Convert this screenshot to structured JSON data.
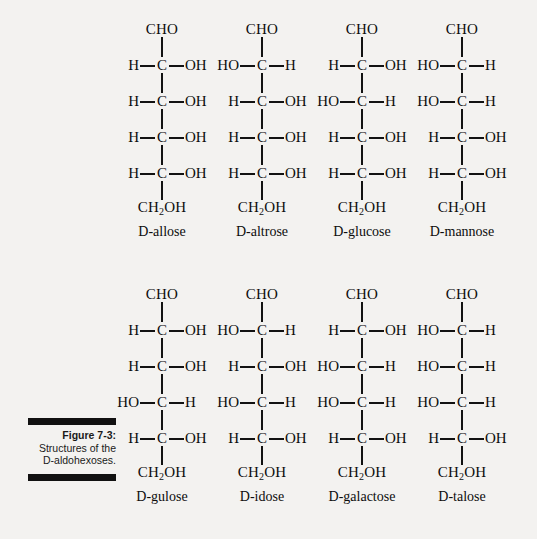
{
  "figure": {
    "caption_label": "Figure 7-3:",
    "caption_text": "Structures of the D-aldohexoses.",
    "background_color": "#f3f2f0",
    "ink_color": "#121212"
  },
  "chart_data": {
    "type": "diagram",
    "title": "Structures of the D-aldohexoses",
    "subtype": "fischer-projection-grid",
    "grid": {
      "rows": 2,
      "columns": 4
    },
    "top_group": "CHO",
    "bottom_group": "CH2OH",
    "stereocenter_count": 4,
    "carbon_symbol": "C",
    "molecules": [
      {
        "name": "D-allose",
        "row": 1,
        "column": 1,
        "top": "CHO",
        "bottom": "CH2OH",
        "centers": [
          {
            "left": "H",
            "right": "OH"
          },
          {
            "left": "H",
            "right": "OH"
          },
          {
            "left": "H",
            "right": "OH"
          },
          {
            "left": "H",
            "right": "OH"
          }
        ]
      },
      {
        "name": "D-altrose",
        "row": 1,
        "column": 2,
        "top": "CHO",
        "bottom": "CH2OH",
        "centers": [
          {
            "left": "HO",
            "right": "H"
          },
          {
            "left": "H",
            "right": "OH"
          },
          {
            "left": "H",
            "right": "OH"
          },
          {
            "left": "H",
            "right": "OH"
          }
        ]
      },
      {
        "name": "D-glucose",
        "row": 1,
        "column": 3,
        "top": "CHO",
        "bottom": "CH2OH",
        "centers": [
          {
            "left": "H",
            "right": "OH"
          },
          {
            "left": "HO",
            "right": "H"
          },
          {
            "left": "H",
            "right": "OH"
          },
          {
            "left": "H",
            "right": "OH"
          }
        ]
      },
      {
        "name": "D-mannose",
        "row": 1,
        "column": 4,
        "top": "CHO",
        "bottom": "CH2OH",
        "centers": [
          {
            "left": "HO",
            "right": "H"
          },
          {
            "left": "HO",
            "right": "H"
          },
          {
            "left": "H",
            "right": "OH"
          },
          {
            "left": "H",
            "right": "OH"
          }
        ]
      },
      {
        "name": "D-gulose",
        "row": 2,
        "column": 1,
        "top": "CHO",
        "bottom": "CH2OH",
        "centers": [
          {
            "left": "H",
            "right": "OH"
          },
          {
            "left": "H",
            "right": "OH"
          },
          {
            "left": "HO",
            "right": "H"
          },
          {
            "left": "H",
            "right": "OH"
          }
        ]
      },
      {
        "name": "D-idose",
        "row": 2,
        "column": 2,
        "top": "CHO",
        "bottom": "CH2OH",
        "centers": [
          {
            "left": "HO",
            "right": "H"
          },
          {
            "left": "H",
            "right": "OH"
          },
          {
            "left": "HO",
            "right": "H"
          },
          {
            "left": "H",
            "right": "OH"
          }
        ]
      },
      {
        "name": "D-galactose",
        "row": 2,
        "column": 3,
        "top": "CHO",
        "bottom": "CH2OH",
        "centers": [
          {
            "left": "H",
            "right": "OH"
          },
          {
            "left": "HO",
            "right": "H"
          },
          {
            "left": "HO",
            "right": "H"
          },
          {
            "left": "H",
            "right": "OH"
          }
        ]
      },
      {
        "name": "D-talose",
        "row": 2,
        "column": 4,
        "top": "CHO",
        "bottom": "CH2OH",
        "centers": [
          {
            "left": "HO",
            "right": "H"
          },
          {
            "left": "HO",
            "right": "H"
          },
          {
            "left": "HO",
            "right": "H"
          },
          {
            "left": "H",
            "right": "OH"
          }
        ]
      }
    ]
  }
}
